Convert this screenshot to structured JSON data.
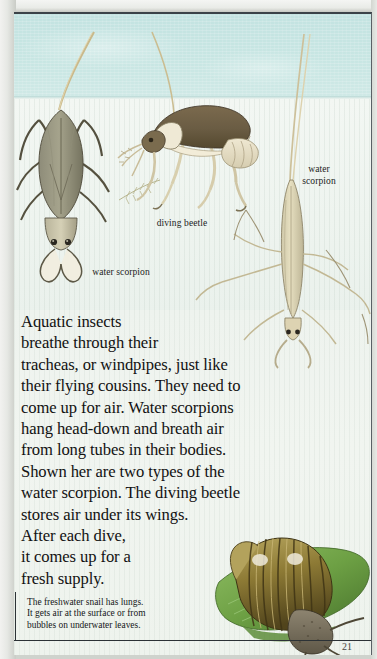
{
  "page": {
    "number": "21",
    "colors": {
      "water": "#c6e5e2",
      "paper": "#eef3ee",
      "ink": "#121212",
      "border": "#2c3236",
      "leaf_green": "#6f9b4a",
      "shell_brown": "#8a7438"
    }
  },
  "illustrations": [
    {
      "name": "water-scorpion-broad",
      "label": "water scorpion",
      "description": "broad flat-bodied water scorpion hanging head-down with long breathing tube"
    },
    {
      "name": "diving-beetle",
      "label": "diving beetle",
      "description": "diving beetle with air stored under its wings"
    },
    {
      "name": "water-scorpion-slender",
      "label": "water scorpion",
      "description": "slender stick-like water scorpion with long legs and breathing tube"
    },
    {
      "name": "freshwater-snail",
      "label": "",
      "description": "freshwater snail with striped conical shell resting on a green leaf"
    }
  ],
  "labels": {
    "water_scorpion_left": "water scorpion",
    "diving_beetle": "diving beetle",
    "water_scorpion_right_line1": "water",
    "water_scorpion_right_line2": "scorpion"
  },
  "body_text": {
    "lines": [
      "Aquatic insects",
      "breathe through their",
      "tracheas, or windpipes, just like",
      "their flying cousins. They need to",
      "come up for air. Water scorpions",
      "hang head-down and breath air",
      "from long tubes in their bodies.",
      "Shown her are two types of the",
      "water scorpion. The diving beetle",
      "stores air under its wings.",
      "After each dive,",
      "it comes up for a",
      "fresh supply."
    ]
  },
  "caption": {
    "lines": [
      "The freshwater snail has lungs.",
      "It gets air at the surface or from",
      "bubbles on underwater leaves."
    ]
  }
}
